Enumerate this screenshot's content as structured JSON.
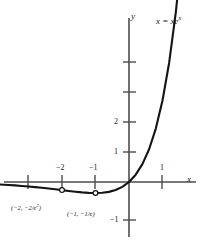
{
  "chart_data": {
    "type": "line",
    "title": "",
    "subtitle": "",
    "function": "y = x*e^x",
    "curve_label": "x = xe",
    "curve_label_exponent": "x",
    "xlabel": "x",
    "ylabel": "y",
    "xlim": [
      -3.85,
      2.25
    ],
    "ylim": [
      -2.0,
      5.4
    ],
    "grid": false,
    "legend": "none",
    "x_ticks": [
      {
        "value": -3,
        "label": ""
      },
      {
        "value": -2,
        "label": "−2"
      },
      {
        "value": -1,
        "label": "−1"
      },
      {
        "value": 1,
        "label": "1"
      }
    ],
    "y_ticks": [
      {
        "value": 4,
        "label": ""
      },
      {
        "value": 3,
        "label": ""
      },
      {
        "value": 2,
        "label": "2"
      },
      {
        "value": 1,
        "label": "1"
      },
      {
        "value": -1,
        "label": "−1"
      }
    ],
    "annotated_points": [
      {
        "x": -2,
        "y": -0.2707,
        "marker": "open-circle",
        "label_prefix": "(−2, −2/e",
        "label_exponent": "2",
        "label_suffix": ")"
      },
      {
        "x": -1,
        "y": -0.3679,
        "marker": "open-circle",
        "label_prefix": "(−1, −1/e",
        "label_exponent": "",
        "label_suffix": ")"
      }
    ],
    "series": [
      {
        "name": "y = x e^x",
        "x": [
          -3.85,
          -3.6,
          -3.4,
          -3.2,
          -3.0,
          -2.8,
          -2.6,
          -2.4,
          -2.2,
          -2.0,
          -1.8,
          -1.6,
          -1.4,
          -1.2,
          -1.0,
          -0.8,
          -0.6,
          -0.4,
          -0.2,
          0.0,
          0.2,
          0.4,
          0.6,
          0.8,
          1.0,
          1.2,
          1.4,
          1.55
        ],
        "y": [
          -0.082,
          -0.098,
          -0.113,
          -0.131,
          -0.149,
          -0.17,
          -0.193,
          -0.218,
          -0.244,
          -0.271,
          -0.298,
          -0.323,
          -0.345,
          -0.361,
          -0.368,
          -0.359,
          -0.329,
          -0.268,
          -0.164,
          0.0,
          0.244,
          0.597,
          1.093,
          1.78,
          2.718,
          3.984,
          5.68,
          7.31
        ]
      }
    ],
    "colors": {
      "curve": "#141414",
      "axis": "#4d4d4d",
      "text": "#1a1a1a",
      "marker_fill": "#ffffff"
    }
  },
  "axis_labels": {
    "x_axis": "x",
    "y_axis": "y"
  }
}
